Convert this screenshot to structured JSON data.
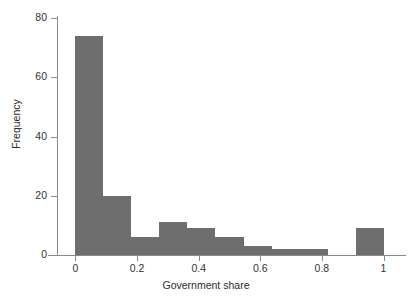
{
  "chart_data": {
    "type": "bar",
    "title": "",
    "subtitle": "",
    "xlabel": "Government share",
    "ylabel": "Frequency",
    "xlim": [
      -0.06,
      1.06
    ],
    "ylim": [
      0,
      82
    ],
    "grid": false,
    "legend": null,
    "bar_color": "#6e6e6e",
    "background_color": "#ffffff",
    "axis_color": "#8a8a8a",
    "x_ticks": [
      0,
      0.2,
      0.4,
      0.6,
      0.8,
      1
    ],
    "x_tick_labels": [
      "0",
      "0.2",
      "0.4",
      "0.6",
      "0.8",
      "1"
    ],
    "y_ticks": [
      0,
      20,
      40,
      60,
      80
    ],
    "y_tick_labels": [
      "0",
      "20",
      "40",
      "60",
      "80"
    ],
    "bin_edges": [
      0,
      0.0909,
      0.1818,
      0.2727,
      0.3636,
      0.4545,
      0.5455,
      0.6364,
      0.7273,
      0.8182,
      0.9091,
      1.0
    ],
    "categories": [
      "0-0.09",
      "0.09-0.18",
      "0.18-0.27",
      "0.27-0.36",
      "0.36-0.45",
      "0.45-0.55",
      "0.55-0.64",
      "0.64-0.73",
      "0.73-0.82",
      "0.82-0.91",
      "0.91-1"
    ],
    "values": [
      74,
      20,
      6,
      11,
      9,
      6,
      3,
      2,
      2,
      0,
      9
    ]
  }
}
